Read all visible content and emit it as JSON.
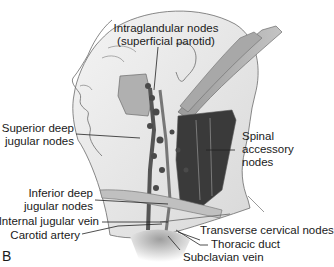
{
  "figure": {
    "panel_letter": "B",
    "labels": [
      {
        "id": "intraglandular",
        "line1": "Intraglandular nodes",
        "line2": "(superficial parotid)"
      },
      {
        "id": "superior-deep-jugular",
        "line1": "Superior deep",
        "line2": "jugular nodes"
      },
      {
        "id": "spinal-accessory",
        "line1": "Spinal",
        "line2": "accessory",
        "line3": "nodes"
      },
      {
        "id": "inferior-deep-jugular",
        "line1": "Inferior deep",
        "line2": "jugular nodes"
      },
      {
        "id": "internal-jugular-vein",
        "line1": "Internal jugular vein"
      },
      {
        "id": "carotid-artery",
        "line1": "Carotid artery"
      },
      {
        "id": "transverse-cervical",
        "line1": "Transverse cervical nodes"
      },
      {
        "id": "thoracic-duct",
        "line1": "Thoracic duct"
      },
      {
        "id": "subclavian-vein",
        "line1": "Subclavian vein"
      }
    ],
    "colors": {
      "outline": "#6b6b6b",
      "skin": "#ececec",
      "muscle_light": "#b5b5b5",
      "muscle_dark": "#3a3a3a",
      "text": "#1a1a1a"
    }
  }
}
